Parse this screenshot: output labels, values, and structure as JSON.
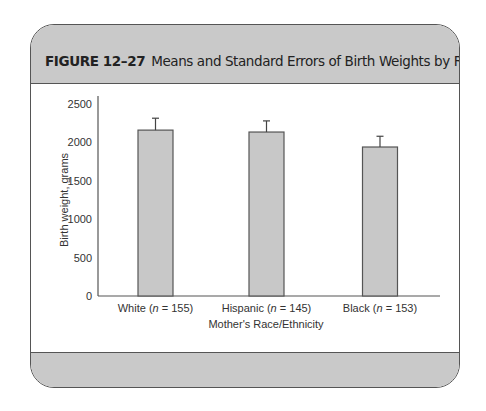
{
  "figure": {
    "number": "FIGURE 12–27",
    "title": "Means and Standard Errors of Birth Weights by Race/Ethnicity"
  },
  "chart_data": {
    "type": "bar",
    "title": "Means and Standard Errors of Birth Weights by Race/Ethnicity",
    "categories": [
      "White (n = 155)",
      "Hispanic (n = 145)",
      "Black (n = 153)"
    ],
    "category_parts": [
      {
        "name": "White",
        "n": "155"
      },
      {
        "name": "Hispanic",
        "n": "145"
      },
      {
        "name": "Black",
        "n": "153"
      }
    ],
    "values": [
      2160,
      2135,
      1940
    ],
    "error": [
      155,
      145,
      140
    ],
    "xlabel": "Mother's Race/Ethnicity",
    "ylabel": "Birth weight, grams",
    "ylim": [
      0,
      2500
    ],
    "yticks": [
      0,
      500,
      1000,
      1500,
      2000,
      2500
    ],
    "grid": false,
    "bar_color": "#c8c8c8",
    "edge_color": "#555555"
  }
}
